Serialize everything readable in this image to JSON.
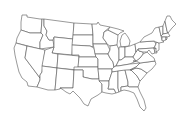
{
  "map": {
    "title": "United States outline map",
    "type": "blank state boundary map",
    "region": "Contiguous United States",
    "colors": {
      "background": "#ffffff",
      "border": "#555555",
      "fill": "#ffffff"
    },
    "labels_visible": false
  }
}
